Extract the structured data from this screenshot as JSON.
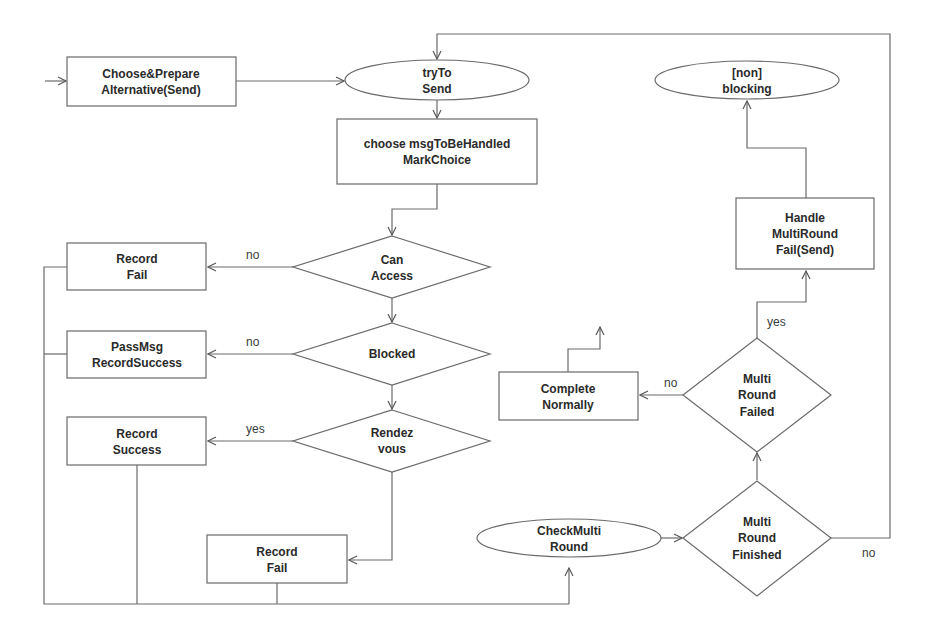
{
  "diagram": {
    "type": "flowchart",
    "nodes": {
      "choose_prepare": {
        "shape": "rect",
        "lines": [
          "Choose&Prepare",
          "Alternative(Send)"
        ]
      },
      "try_to_send": {
        "shape": "ellipse",
        "lines": [
          "tryTo",
          "Send"
        ]
      },
      "choose_msg": {
        "shape": "rect",
        "lines": [
          "choose msgToBeHandled",
          "MarkChoice"
        ]
      },
      "can_access": {
        "shape": "diamond",
        "lines": [
          "Can",
          "Access"
        ]
      },
      "record_fail_1": {
        "shape": "rect",
        "lines": [
          "Record",
          "Fail"
        ]
      },
      "blocked": {
        "shape": "diamond",
        "lines": [
          "Blocked"
        ]
      },
      "passmsg": {
        "shape": "rect",
        "lines": [
          "PassMsg",
          "RecordSuccess"
        ]
      },
      "rendezvous": {
        "shape": "diamond",
        "lines": [
          "Rendez",
          "vous"
        ]
      },
      "record_success": {
        "shape": "rect",
        "lines": [
          "Record",
          "Success"
        ]
      },
      "record_fail_2": {
        "shape": "rect",
        "lines": [
          "Record",
          "Fail"
        ]
      },
      "check_multi": {
        "shape": "ellipse",
        "lines": [
          "CheckMulti",
          "Round"
        ]
      },
      "multi_finished": {
        "shape": "diamond",
        "lines": [
          "Multi",
          "Round",
          "Finished"
        ]
      },
      "multi_failed": {
        "shape": "diamond",
        "lines": [
          "Multi",
          "Round",
          "Failed"
        ]
      },
      "complete_normally": {
        "shape": "rect",
        "lines": [
          "Complete",
          "Normally"
        ]
      },
      "handle_multi": {
        "shape": "rect",
        "lines": [
          "Handle",
          "MultiRound",
          "Fail(Send)"
        ]
      },
      "non_blocking": {
        "shape": "ellipse",
        "lines": [
          "[non]",
          "blocking"
        ]
      }
    },
    "edge_labels": {
      "can_access_no": "no",
      "blocked_no": "no",
      "rendezvous_yes": "yes",
      "multi_failed_no": "no",
      "multi_failed_yes": "yes",
      "multi_finished_no": "no"
    },
    "edges": [
      {
        "from": "start",
        "to": "choose_prepare"
      },
      {
        "from": "choose_prepare",
        "to": "try_to_send"
      },
      {
        "from": "try_to_send",
        "to": "choose_msg"
      },
      {
        "from": "choose_msg",
        "to": "can_access"
      },
      {
        "from": "can_access",
        "to": "record_fail_1",
        "label": "no"
      },
      {
        "from": "can_access",
        "to": "blocked"
      },
      {
        "from": "blocked",
        "to": "passmsg",
        "label": "no"
      },
      {
        "from": "blocked",
        "to": "rendezvous"
      },
      {
        "from": "rendezvous",
        "to": "record_success",
        "label": "yes"
      },
      {
        "from": "rendezvous",
        "to": "record_fail_2"
      },
      {
        "from": "record_fail_1",
        "to": "check_multi"
      },
      {
        "from": "passmsg",
        "to": "check_multi"
      },
      {
        "from": "record_success",
        "to": "check_multi"
      },
      {
        "from": "record_fail_2",
        "to": "check_multi"
      },
      {
        "from": "check_multi",
        "to": "multi_finished"
      },
      {
        "from": "multi_finished",
        "to": "multi_failed"
      },
      {
        "from": "multi_finished",
        "to": "try_to_send",
        "label": "no"
      },
      {
        "from": "multi_failed",
        "to": "complete_normally",
        "label": "no"
      },
      {
        "from": "multi_failed",
        "to": "handle_multi",
        "label": "yes"
      },
      {
        "from": "handle_multi",
        "to": "non_blocking"
      },
      {
        "from": "complete_normally",
        "to": "exit"
      }
    ]
  }
}
